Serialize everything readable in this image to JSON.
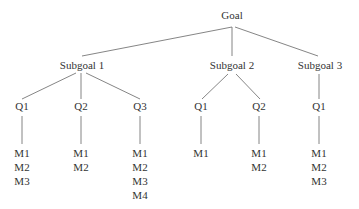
{
  "diagram": {
    "type": "tree",
    "root": {
      "label": "Goal",
      "x": 232,
      "y": 9
    },
    "subgoals": [
      {
        "label": "Subgoal 1",
        "x": 82,
        "y": 59,
        "questions": [
          {
            "label": "Q1",
            "x": 22,
            "metrics": [
              "M1",
              "M2",
              "M3"
            ]
          },
          {
            "label": "Q2",
            "x": 81,
            "metrics": [
              "M1",
              "M2"
            ]
          },
          {
            "label": "Q3",
            "x": 140,
            "metrics": [
              "M1",
              "M2",
              "M3",
              "M4"
            ]
          }
        ]
      },
      {
        "label": "Subgoal 2",
        "x": 232,
        "y": 59,
        "questions": [
          {
            "label": "Q1",
            "x": 201,
            "metrics": [
              "M1"
            ]
          },
          {
            "label": "Q2",
            "x": 259,
            "metrics": [
              "M1",
              "M2"
            ]
          }
        ]
      },
      {
        "label": "Subgoal 3",
        "x": 320,
        "y": 59,
        "questions": [
          {
            "label": "Q1",
            "x": 319,
            "metrics": [
              "M1",
              "M2",
              "M3"
            ]
          }
        ]
      }
    ],
    "line_color": "#555555",
    "question_y": 100,
    "metrics_y": 146
  }
}
